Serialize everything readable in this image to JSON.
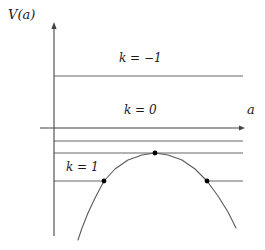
{
  "figure": {
    "axes": {
      "y_label": "V(a)",
      "x_label": "a",
      "y_axis_x": 54,
      "y_axis_top": 22,
      "y_axis_bottom": 236,
      "x_axis_y": 128,
      "x_axis_left": 40,
      "x_axis_right": 245,
      "line_right_end": 243
    },
    "stroke_color": "#555555",
    "axis_color": "#444444",
    "curve_color": "#5a5a5a",
    "dot_color": "#000000",
    "labels": {
      "k_negative_one": "k = −1",
      "k_zero": "k = 0",
      "k_one": "k = 1"
    }
  },
  "chart_data": {
    "type": "line",
    "title": "V(a)",
    "xlabel": "a",
    "ylabel": "V(a)",
    "grid": false,
    "legend": "none",
    "xlim": [
      0,
      245
    ],
    "ylim": [
      250,
      0
    ],
    "series": [
      {
        "name": "V(a) inverted parabola",
        "type": "curve",
        "points": [
          [
            78,
            240
          ],
          [
            82,
            228
          ],
          [
            88,
            213
          ],
          [
            95,
            198
          ],
          [
            104,
            181
          ],
          [
            115,
            169
          ],
          [
            128,
            160
          ],
          [
            142,
            155
          ],
          [
            155,
            153
          ],
          [
            168,
            155
          ],
          [
            182,
            160
          ],
          [
            195,
            169
          ],
          [
            207,
            181
          ],
          [
            218,
            196
          ],
          [
            228,
            212
          ],
          [
            236,
            228
          ]
        ]
      }
    ],
    "horizontal_levels": [
      {
        "name": "k = -1 level",
        "label": "k = −1",
        "y": 76,
        "x_start": 54,
        "x_end": 243,
        "segments": [
          [
            54,
            243
          ]
        ]
      },
      {
        "name": "k = 0 level (axis)",
        "label": "k = 0",
        "y": 128,
        "x_start": 40,
        "x_end": 245,
        "segments": [
          [
            40,
            245
          ]
        ],
        "is_axis": true
      },
      {
        "name": "unlabeled level between k=0 and peak",
        "label": "",
        "y": 141,
        "x_start": 54,
        "x_end": 243,
        "segments": [
          [
            54,
            243
          ]
        ]
      },
      {
        "name": "tangent level at peak",
        "label": "",
        "y": 153,
        "x_start": 54,
        "x_end": 243,
        "segments": [
          [
            54,
            243
          ]
        ]
      },
      {
        "name": "k = 1 level (turning points)",
        "label": "k = 1",
        "y": 181,
        "x_start": 54,
        "x_end": 243,
        "segments": [
          [
            54,
            104
          ],
          [
            207,
            243
          ]
        ]
      }
    ],
    "marked_points": [
      {
        "name": "left turning point",
        "x": 104,
        "y": 181
      },
      {
        "name": "maximum of potential",
        "x": 155,
        "y": 153
      },
      {
        "name": "right turning point",
        "x": 207,
        "y": 181
      }
    ]
  }
}
